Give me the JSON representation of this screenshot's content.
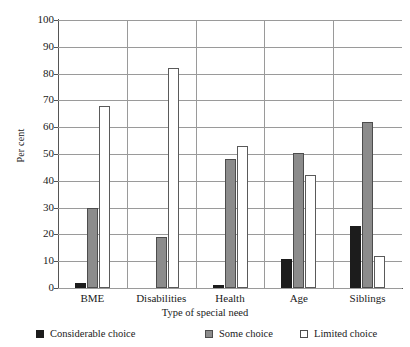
{
  "chart_data": {
    "type": "bar",
    "title": "",
    "subtitle": "",
    "xlabel": "Type of special need",
    "ylabel": "Per cent",
    "categories": [
      "BME",
      "Disabilities",
      "Health",
      "Age",
      "Siblings"
    ],
    "series": [
      {
        "name": "Considerable choice",
        "color": "#1c1c1c",
        "values": [
          2,
          0,
          1,
          11,
          23
        ]
      },
      {
        "name": "Some choice",
        "color": "#8c8c8c",
        "values": [
          30,
          19,
          48,
          50.5,
          62
        ]
      },
      {
        "name": "Limited choice",
        "color": "#ffffff",
        "values": [
          68,
          82,
          53,
          42,
          12
        ]
      }
    ],
    "ylim": [
      0,
      100
    ],
    "ytick_step": 10,
    "yticks": [
      0,
      10,
      20,
      30,
      40,
      50,
      60,
      70,
      80,
      90,
      100
    ],
    "ytick_labels": [
      "0",
      "10",
      "20",
      "30",
      "40",
      "50",
      "60",
      "70",
      "80",
      "90",
      "100"
    ],
    "grid": true,
    "grid_axis": "y",
    "legend_position": "bottom",
    "legend_entries": [
      "Considerable choice",
      "Some choice",
      "Limited choice"
    ]
  }
}
